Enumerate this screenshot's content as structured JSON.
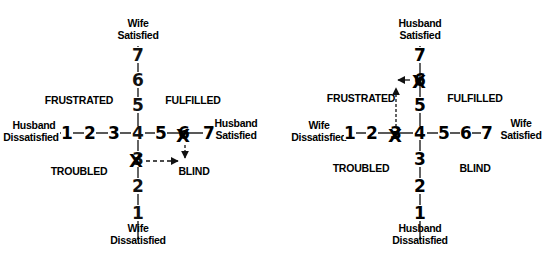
{
  "diagrams": [
    {
      "id": "left",
      "vertical_axis": {
        "top_label_1": "Wife",
        "top_label_2": "Satisfied",
        "bottom_label_1": "Wife",
        "bottom_label_2": "Dissatisfied",
        "ticks": [
          "7",
          "6",
          "5",
          "4",
          "3",
          "2",
          "1"
        ]
      },
      "horizontal_axis": {
        "left_label_1": "Husband",
        "left_label_2": "Dissatisfied",
        "right_label_1": "Husband",
        "right_label_2": "Satisfied",
        "ticks": [
          "1",
          "2",
          "3",
          "4",
          "5",
          "6",
          "7"
        ]
      },
      "quadrants": {
        "top_left": "FRUSTRATED",
        "top_right": "FULFILLED",
        "bottom_left": "TROUBLED",
        "bottom_right": "BLIND"
      },
      "marks": [
        {
          "axis": "horizontal",
          "value": "6",
          "symbol": "X"
        },
        {
          "axis": "vertical",
          "value": "3",
          "symbol": "X"
        }
      ],
      "arrows": [
        "down-to-BLIND",
        "right-to-BLIND"
      ]
    },
    {
      "id": "right",
      "vertical_axis": {
        "top_label_1": "Husband",
        "top_label_2": "Satisfied",
        "bottom_label_1": "Husband",
        "bottom_label_2": "Dissatisfied",
        "ticks": [
          "7",
          "6",
          "5",
          "4",
          "3",
          "2",
          "1"
        ]
      },
      "horizontal_axis": {
        "left_label_1": "Wife",
        "left_label_2": "Dissatisfied",
        "right_label_1": "Wife",
        "right_label_2": "Satisfied",
        "ticks": [
          "1",
          "2",
          "3",
          "4",
          "5",
          "6",
          "7"
        ]
      },
      "quadrants": {
        "top_left": "FRUSTRATED",
        "top_right": "FULFILLED",
        "bottom_left": "TROUBLED",
        "bottom_right": "BLIND"
      },
      "marks": [
        {
          "axis": "vertical",
          "value": "6",
          "symbol": "X"
        },
        {
          "axis": "horizontal",
          "value": "3",
          "symbol": "X"
        }
      ],
      "arrows": [
        "left-to-FRUSTRATED",
        "up-to-FRUSTRATED"
      ]
    }
  ]
}
